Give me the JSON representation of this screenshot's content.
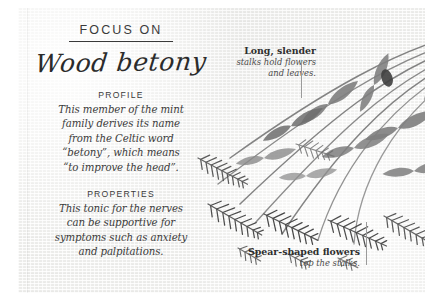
{
  "card": {
    "eyebrow": "FOCUS ON",
    "title": "Wood betony",
    "sections": [
      {
        "heading": "PROFILE",
        "lines": [
          "This member of the mint",
          "family derives its name",
          "from the Celtic word",
          "“betony”, which means",
          "“to improve the head”."
        ]
      },
      {
        "heading": "PROPERTIES",
        "lines": [
          "This tonic for the nerves",
          "can be supportive for",
          "symptoms such as anxiety",
          "and palpitations."
        ]
      }
    ]
  },
  "annotations": [
    {
      "heading": "Long, slender",
      "sub_lines": [
        "stalks hold flowers",
        "and leaves."
      ]
    },
    {
      "heading": "Spear-shaped flowers",
      "sub_lines": [
        "top the stalks."
      ]
    }
  ],
  "illustration": {
    "subject": "wood-betony-plant",
    "description": "Grayscale botanical illustration of wood betony: long slender stalks with paired leaves and bristly spear-shaped flower spikes."
  },
  "colors": {
    "paper": "#f3f3f1",
    "ink": "#2f2f2f",
    "rule": "#3a3a3a",
    "leader": "#9a9a9a",
    "illustration_dark": "#4a4a4a",
    "illustration_mid": "#7d7d7d",
    "illustration_light": "#a9a9a9"
  }
}
